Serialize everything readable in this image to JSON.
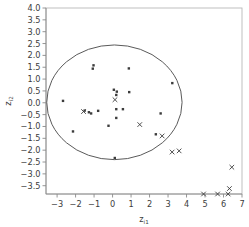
{
  "chart_data": {
    "type": "scatter",
    "title": "",
    "subtitle": "",
    "xlabel": "z_i1",
    "xlabel_base": "z",
    "xlabel_sub": "i1",
    "ylabel": "z_i2",
    "ylabel_base": "z",
    "ylabel_sub": "i2",
    "xlim": [
      -3.6,
      7.0
    ],
    "ylim": [
      -3.85,
      4.0
    ],
    "grid": false,
    "legend": null,
    "xticks": [
      -3,
      -2,
      -1,
      0,
      1,
      2,
      3,
      4,
      5,
      6,
      7
    ],
    "xtick_labels": [
      "-3",
      "-2",
      "-1",
      "0",
      "1",
      "2",
      "3",
      "4",
      "5",
      "6",
      "7"
    ],
    "yticks": [
      4.0,
      3.5,
      3.0,
      2.5,
      2.0,
      1.5,
      1.0,
      0.5,
      0.0,
      -0.5,
      -1.0,
      -1.5,
      -2.0,
      -2.5,
      -3.0,
      -3.5
    ],
    "ytick_labels": [
      "4.0",
      "3.5",
      "3.0",
      "2.5",
      "2.0",
      "1.5",
      "1.0",
      "0.5",
      "0.0",
      "-0.5",
      "-1.0",
      "-1.5",
      "-2.0",
      "-2.5",
      "-3.0",
      "-3.5"
    ],
    "marker_colors": {
      "dot": "#3c3c3c",
      "cross": "#3c3c3c",
      "ellipse": "#5a5a5a",
      "frame": "#b8b8b8",
      "axis": "#8a8a8a"
    },
    "series": [
      {
        "name": "inliers",
        "marker": "dot",
        "points": [
          [
            -1.03,
            1.58
          ],
          [
            -1.07,
            1.44
          ],
          [
            0.88,
            1.45
          ],
          [
            3.23,
            0.83
          ],
          [
            0.07,
            0.55
          ],
          [
            0.23,
            0.47
          ],
          [
            0.2,
            0.33
          ],
          [
            0.9,
            0.45
          ],
          [
            -2.68,
            0.08
          ],
          [
            -1.51,
            -0.33
          ],
          [
            -1.28,
            -0.4
          ],
          [
            -1.16,
            -0.45
          ],
          [
            -0.78,
            -0.34
          ],
          [
            0.2,
            -0.27
          ],
          [
            0.56,
            -0.27
          ],
          [
            0.2,
            -0.64
          ],
          [
            -2.14,
            -1.21
          ],
          [
            -0.22,
            -0.97
          ],
          [
            2.6,
            -0.45
          ],
          [
            2.34,
            -1.33
          ],
          [
            0.12,
            -2.33
          ]
        ]
      },
      {
        "name": "flagged",
        "marker": "cross",
        "points": [
          [
            0.13,
            0.13
          ],
          [
            -1.57,
            -0.37
          ],
          [
            1.47,
            -0.92
          ],
          [
            2.68,
            -1.4
          ],
          [
            3.22,
            -2.08
          ],
          [
            3.6,
            -2.03
          ],
          [
            6.45,
            -2.72
          ],
          [
            6.32,
            -3.62
          ],
          [
            4.92,
            -3.85
          ],
          [
            5.68,
            -3.85
          ],
          [
            6.25,
            -3.85
          ]
        ]
      }
    ],
    "ellipse": {
      "cx": 0.1,
      "cy": 0.02,
      "rx": 3.66,
      "ry": 2.42,
      "description": "tolerance-ellipse"
    }
  }
}
